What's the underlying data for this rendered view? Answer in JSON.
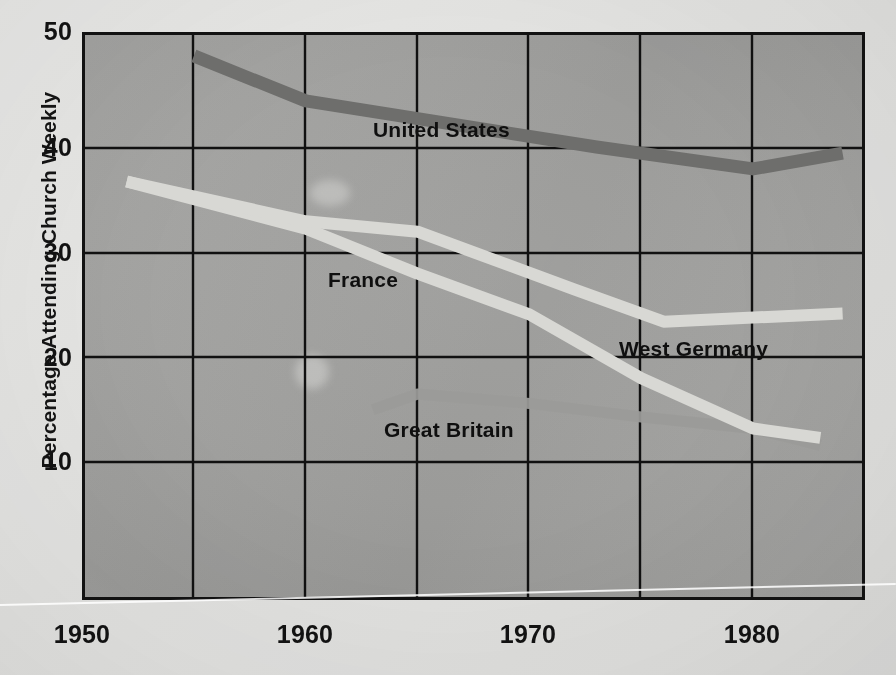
{
  "chart_data": {
    "type": "line",
    "title": "",
    "xlabel": "",
    "ylabel": "Percentage Attending Church Weekly",
    "xlim": [
      1950,
      1985
    ],
    "ylim": [
      0,
      50
    ],
    "xticks": [
      1950,
      1960,
      1970,
      1980
    ],
    "xtick_labels": [
      "1950",
      "1960",
      "1970",
      "1980"
    ],
    "yticks": [
      10,
      20,
      30,
      40,
      50
    ],
    "ytick_labels": [
      "10",
      "20",
      "30",
      "40",
      "50"
    ],
    "x_gridlines": [
      1950,
      1955,
      1960,
      1965,
      1970,
      1975,
      1980,
      1985
    ],
    "y_gridlines": [
      10,
      20,
      30,
      40
    ],
    "grid": true,
    "legend": "inline-labels",
    "series": [
      {
        "name": "United States",
        "color": "#6e6e6c",
        "label_x": 1963.0,
        "label_y": 41.6,
        "x": [
          1955,
          1960,
          1973,
          1980,
          1984
        ],
        "y": [
          48.8,
          44.5,
          40.1,
          38.0,
          39.5
        ]
      },
      {
        "name": "West Germany",
        "color": "#d8d8d4",
        "label_x": 1974.0,
        "label_y": 20.7,
        "x": [
          1952,
          1960,
          1965,
          1972,
          1976,
          1984
        ],
        "y": [
          36.8,
          33.0,
          32.0,
          26.5,
          23.4,
          24.2
        ]
      },
      {
        "name": "France",
        "color": "#d8d8d4",
        "label_x": 1961.0,
        "label_y": 27.3,
        "x": [
          1952,
          1960,
          1965,
          1970,
          1975,
          1980,
          1983
        ],
        "y": [
          36.8,
          32.3,
          28.0,
          24.1,
          18.0,
          13.2,
          12.3
        ]
      },
      {
        "name": "Great Britain",
        "color": "#9b9b99",
        "label_x": 1963.5,
        "label_y": 13.0,
        "x": [
          1963,
          1965,
          1970,
          1975,
          1980,
          1983
        ],
        "y": [
          15.0,
          16.5,
          15.6,
          14.3,
          13.2,
          11.6
        ]
      }
    ]
  },
  "axes": {
    "y_axis_title": "Percentage Attending Church Weekly",
    "ytick_labels": [
      "50",
      "40",
      "30",
      "20",
      "10"
    ],
    "xtick_labels": [
      "1950",
      "1960",
      "1970",
      "1980"
    ]
  },
  "series_labels": {
    "united_states": "United States",
    "france": "France",
    "west_germany": "West Germany",
    "great_britain": "Great Britain"
  },
  "colors": {
    "background": "#e4e4e2",
    "plot_background": "#a3a3a1",
    "axis": "#121212",
    "united_states": "#6e6e6c",
    "france": "#d8d8d4",
    "west_germany": "#d8d8d4",
    "great_britain": "#9b9b99"
  }
}
